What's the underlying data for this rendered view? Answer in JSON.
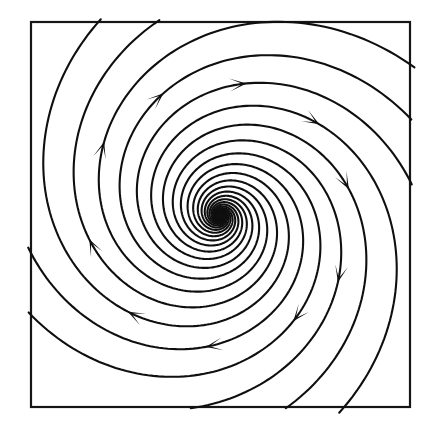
{
  "figure": {
    "kind": "phase-portrait",
    "background_color": "#ffffff",
    "ink_color": "#0f0f0f",
    "frame": {
      "stroke_color": "#161616",
      "stroke_width": 2.2,
      "x": 31,
      "y": 22,
      "width": 379,
      "height": 385
    },
    "equilibrium": {
      "label": "spiral source",
      "x": 220,
      "y": 216,
      "dot_radius": 3.2,
      "stability": "unstable",
      "flow_direction": "outward",
      "rotation_sense": "clockwise"
    },
    "spiral_model": {
      "type": "logarithmic",
      "growth_b": 0.3,
      "r_start": 3,
      "r_end": 300,
      "arm_count": 10,
      "arm_phase_step_deg": 36,
      "arm_phase_offset_deg": -14
    },
    "arrow_marker": {
      "length": 17,
      "half_width": 6.5,
      "notch": 4.0,
      "placement_radius_fraction": 0.62
    },
    "arms": [
      {
        "id": "arm-1",
        "phase_deg": -14,
        "arrow_point": {
          "x": 358,
          "y": 185
        },
        "arrow_dir_deg": 10
      },
      {
        "id": "arm-2",
        "phase_deg": 22,
        "arrow_point": {
          "x": 362,
          "y": 290
        },
        "arrow_dir_deg": 62
      },
      {
        "id": "arm-3",
        "phase_deg": 58,
        "arrow_point": {
          "x": 291,
          "y": 320
        },
        "arrow_dir_deg": 105
      },
      {
        "id": "arm-4",
        "phase_deg": 94,
        "arrow_point": {
          "x": 208,
          "y": 352
        },
        "arrow_dir_deg": 140
      },
      {
        "id": "arm-5",
        "phase_deg": 130,
        "arrow_point": {
          "x": 120,
          "y": 323
        },
        "arrow_dir_deg": 182
      },
      {
        "id": "arm-6",
        "phase_deg": 166,
        "arrow_point": {
          "x": 82,
          "y": 245
        },
        "arrow_dir_deg": 192
      },
      {
        "id": "arm-7",
        "phase_deg": 202,
        "arrow_point": {
          "x": 81,
          "y": 134
        },
        "arrow_dir_deg": 244
      },
      {
        "id": "arm-8",
        "phase_deg": 238,
        "arrow_point": {
          "x": 155,
          "y": 86
        },
        "arrow_dir_deg": 284
      },
      {
        "id": "arm-9",
        "phase_deg": 274,
        "arrow_point": {
          "x": 245,
          "y": 68
        },
        "arrow_dir_deg": 318
      },
      {
        "id": "arm-10",
        "phase_deg": 310,
        "arrow_point": {
          "x": 330,
          "y": 108
        },
        "arrow_dir_deg": 352
      }
    ],
    "text_labels": [],
    "axes": {
      "visible": false,
      "tick_labels": []
    }
  },
  "chart_data": {
    "type": "line",
    "title": "",
    "xlabel": "",
    "ylabel": "",
    "grid": false,
    "legend": "none",
    "series_note": "Ten logarithmic-spiral trajectories r(t)=r0*exp(0.30*t), theta(t)=t, each rotated 36 degrees from the previous, clipped to the square frame.",
    "series_count": 10
  }
}
